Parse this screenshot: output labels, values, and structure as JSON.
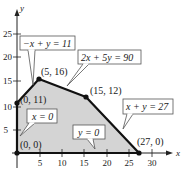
{
  "axes": {
    "x_label": "x",
    "y_label": "y",
    "x_ticks": [
      "5",
      "10",
      "15",
      "20",
      "25",
      "30"
    ],
    "y_ticks": [
      "5",
      "10",
      "15",
      "20",
      "25"
    ]
  },
  "region": {
    "fill": "#d4d4d4",
    "edge_color": "#111111",
    "vertices": [
      {
        "label": "(0, 0)",
        "x": 0,
        "y": 0
      },
      {
        "label": "(0, 11)",
        "x": 0,
        "y": 11
      },
      {
        "label": "(5, 16)",
        "x": 5,
        "y": 16
      },
      {
        "label": "(15, 12)",
        "x": 15,
        "y": 12
      },
      {
        "label": "(27, 0)",
        "x": 27,
        "y": 0
      }
    ]
  },
  "constraints": [
    {
      "label": "−x + y = 11"
    },
    {
      "label": "2x + 5y = 90"
    },
    {
      "label": "x + y = 27"
    },
    {
      "label": "x = 0"
    },
    {
      "label": "y = 0"
    }
  ]
}
